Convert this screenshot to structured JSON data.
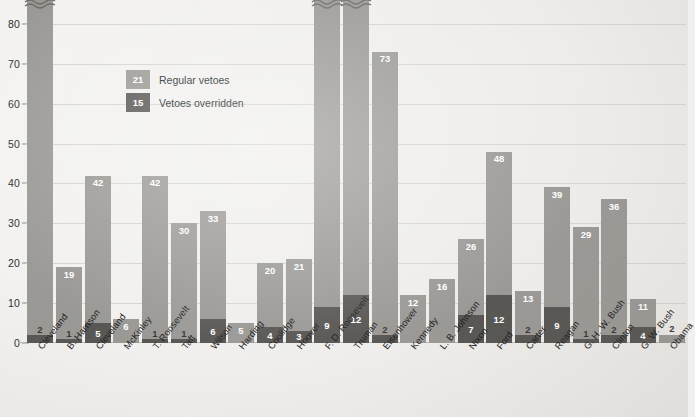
{
  "chart_data": {
    "type": "bar",
    "stacked": true,
    "title": "",
    "subtitle": "",
    "xlabel": "",
    "ylabel": "",
    "ylim": [
      0,
      85
    ],
    "yticks": [
      0,
      10,
      20,
      30,
      40,
      50,
      60,
      70,
      80
    ],
    "grid": true,
    "legend_position": "inside-top-left",
    "legend": [
      {
        "sample_value": "21",
        "label": "Regular vetoes",
        "color": "#9b9995",
        "series": "regular_vetoes"
      },
      {
        "sample_value": "15",
        "label": "Vetoes overridden",
        "color": "#595754",
        "series": "vetoes_overridden"
      }
    ],
    "categories": [
      "Cleveland",
      "B. Harrison",
      "Cleveland",
      "McKinley",
      "T. Roosevelt",
      "Taft",
      "Wilson",
      "Harding",
      "Coolidge",
      "Hoover",
      "F. D. Roosevelt",
      "Truman",
      "Eisenhower",
      "Kennedy",
      "L. B. Johnson",
      "Nixon",
      "Ford",
      "Carter",
      "Reagan",
      "G. H. W. Bush",
      "Clinton",
      "G. W. Bush",
      "Obama"
    ],
    "series": [
      {
        "name": "Regular vetoes",
        "color": "#9b9995",
        "values": [
          304,
          19,
          42,
          6,
          42,
          30,
          33,
          5,
          20,
          21,
          372,
          180,
          73,
          12,
          16,
          26,
          48,
          13,
          39,
          29,
          36,
          11,
          2
        ]
      },
      {
        "name": "Vetoes overridden",
        "color": "#595754",
        "values": [
          2,
          1,
          5,
          0,
          1,
          1,
          6,
          0,
          4,
          3,
          9,
          12,
          2,
          0,
          0,
          7,
          12,
          2,
          9,
          1,
          2,
          4,
          0
        ]
      }
    ],
    "truncated_bars": [
      {
        "category": "Cleveland",
        "displayed_value": 304
      },
      {
        "category": "F. D. Roosevelt",
        "displayed_value": 372
      },
      {
        "category": "Truman",
        "displayed_value": 180
      }
    ]
  },
  "colors": {
    "regular": "#9b9995",
    "overridden": "#595754",
    "background": "#f1f0ee",
    "gridline": "#d6d4d0",
    "axis_text": "#2f2d2b"
  }
}
